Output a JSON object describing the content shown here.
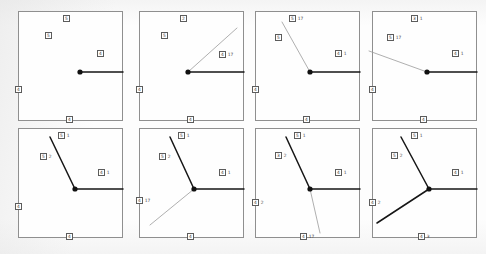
{
  "figure": {
    "type": "multi-panel-line-diagram",
    "panel_count": 8,
    "rows": 2,
    "cols": 4,
    "background_color": "#fdfdfd",
    "panel_border_color": "#8f8f8f",
    "hub_color": "#111111",
    "solid_line_color": "#161616",
    "faint_line_color": "#9a9a9a"
  },
  "panels": [
    {
      "id": "panel-1",
      "name": "panel-1",
      "hub": {
        "x": 61,
        "y": 60
      },
      "edges": [
        {
          "name": "edge-right",
          "style": "solid",
          "x2": 104,
          "y2": 60
        }
      ],
      "labels": [
        {
          "name": "label-top",
          "box": "5",
          "val": "",
          "x": 44,
          "y": 3
        },
        {
          "name": "label-inner",
          "box": "5",
          "val": "",
          "x": 26,
          "y": 20
        },
        {
          "name": "label-right",
          "box": "4",
          "val": "",
          "x": 78,
          "y": 38
        },
        {
          "name": "label-left",
          "box": "4",
          "val": "",
          "x": -4,
          "y": 74
        },
        {
          "name": "label-bottom",
          "box": "4",
          "val": "",
          "x": 47,
          "y": 104
        }
      ]
    },
    {
      "id": "panel-2",
      "name": "panel-2",
      "hub": {
        "x": 48,
        "y": 60
      },
      "edges": [
        {
          "name": "edge-right",
          "style": "solid",
          "x2": 104,
          "y2": 60
        },
        {
          "name": "edge-up-right",
          "style": "faint",
          "x2": 97,
          "y2": 16
        }
      ],
      "labels": [
        {
          "name": "label-top",
          "box": "2",
          "val": "",
          "x": 40,
          "y": 3
        },
        {
          "name": "label-inner",
          "box": "5",
          "val": "",
          "x": 21,
          "y": 20
        },
        {
          "name": "label-right",
          "box": "4",
          "val": "17",
          "x": 79,
          "y": 39
        },
        {
          "name": "label-left",
          "box": "4",
          "val": "",
          "x": -4,
          "y": 74
        },
        {
          "name": "label-bottom",
          "box": "4",
          "val": "",
          "x": 47,
          "y": 104
        }
      ]
    },
    {
      "id": "panel-3",
      "name": "panel-3",
      "hub": {
        "x": 54,
        "y": 60
      },
      "edges": [
        {
          "name": "edge-right",
          "style": "solid",
          "x2": 104,
          "y2": 60
        },
        {
          "name": "edge-up-left",
          "style": "faint",
          "x2": 26,
          "y2": 10
        }
      ],
      "labels": [
        {
          "name": "label-top",
          "box": "5",
          "val": "17",
          "x": 33,
          "y": 3
        },
        {
          "name": "label-inner",
          "box": "5",
          "val": "",
          "x": 19,
          "y": 22
        },
        {
          "name": "label-right",
          "box": "4",
          "val": "1",
          "x": 79,
          "y": 38
        },
        {
          "name": "label-left",
          "box": "4",
          "val": "",
          "x": -4,
          "y": 74
        },
        {
          "name": "label-bottom",
          "box": "4",
          "val": "",
          "x": 47,
          "y": 104
        }
      ]
    },
    {
      "id": "panel-4",
      "name": "panel-4",
      "hub": {
        "x": 54,
        "y": 60
      },
      "edges": [
        {
          "name": "edge-right",
          "style": "solid",
          "x2": 104,
          "y2": 60
        },
        {
          "name": "edge-up-left",
          "style": "faint",
          "x2": -4,
          "y2": 39
        }
      ],
      "labels": [
        {
          "name": "label-top",
          "box": "3",
          "val": "1",
          "x": 38,
          "y": 3
        },
        {
          "name": "label-inner",
          "box": "5",
          "val": "17",
          "x": 14,
          "y": 22
        },
        {
          "name": "label-right",
          "box": "4",
          "val": "1",
          "x": 79,
          "y": 38
        },
        {
          "name": "label-left",
          "box": "4",
          "val": "",
          "x": -4,
          "y": 74
        },
        {
          "name": "label-bottom",
          "box": "4",
          "val": "",
          "x": 47,
          "y": 104
        }
      ]
    },
    {
      "id": "panel-5",
      "name": "panel-5",
      "hub": {
        "x": 56,
        "y": 60
      },
      "edges": [
        {
          "name": "edge-right",
          "style": "solid",
          "x2": 104,
          "y2": 60
        },
        {
          "name": "edge-up-left",
          "style": "solid",
          "x2": 31,
          "y2": 8
        }
      ],
      "labels": [
        {
          "name": "label-top",
          "box": "5",
          "val": "1",
          "x": 39,
          "y": 3
        },
        {
          "name": "label-inner",
          "box": "5",
          "val": "2",
          "x": 21,
          "y": 24
        },
        {
          "name": "label-right",
          "box": "4",
          "val": "1",
          "x": 79,
          "y": 40
        },
        {
          "name": "label-left",
          "box": "4",
          "val": "",
          "x": -4,
          "y": 74
        },
        {
          "name": "label-bottom",
          "box": "4",
          "val": "",
          "x": 47,
          "y": 104
        }
      ]
    },
    {
      "id": "panel-6",
      "name": "panel-6",
      "hub": {
        "x": 54,
        "y": 60
      },
      "edges": [
        {
          "name": "edge-right",
          "style": "solid",
          "x2": 104,
          "y2": 60
        },
        {
          "name": "edge-up-left",
          "style": "solid",
          "x2": 30,
          "y2": 8
        },
        {
          "name": "edge-down-left",
          "style": "faint",
          "x2": 10,
          "y2": 96
        }
      ],
      "labels": [
        {
          "name": "label-top",
          "box": "5",
          "val": "1",
          "x": 38,
          "y": 3
        },
        {
          "name": "label-inner",
          "box": "5",
          "val": "2",
          "x": 19,
          "y": 24
        },
        {
          "name": "label-right",
          "box": "4",
          "val": "1",
          "x": 79,
          "y": 40
        },
        {
          "name": "label-left",
          "box": "4",
          "val": "17",
          "x": -4,
          "y": 68
        },
        {
          "name": "label-bottom",
          "box": "4",
          "val": "",
          "x": 47,
          "y": 104
        }
      ]
    },
    {
      "id": "panel-7",
      "name": "panel-7",
      "hub": {
        "x": 54,
        "y": 60
      },
      "edges": [
        {
          "name": "edge-right",
          "style": "solid",
          "x2": 104,
          "y2": 60
        },
        {
          "name": "edge-up-left",
          "style": "solid",
          "x2": 30,
          "y2": 8
        },
        {
          "name": "edge-down-right",
          "style": "faint",
          "x2": 64,
          "y2": 104
        }
      ],
      "labels": [
        {
          "name": "label-top",
          "box": "5",
          "val": "1",
          "x": 38,
          "y": 3
        },
        {
          "name": "label-inner",
          "box": "3",
          "val": "2",
          "x": 19,
          "y": 23
        },
        {
          "name": "label-right",
          "box": "4",
          "val": "1",
          "x": 79,
          "y": 40
        },
        {
          "name": "label-left",
          "box": "4",
          "val": "2",
          "x": -4,
          "y": 70
        },
        {
          "name": "label-bottom",
          "box": "4",
          "val": "17",
          "x": 44,
          "y": 104
        }
      ]
    },
    {
      "id": "panel-8",
      "name": "panel-8",
      "hub": {
        "x": 56,
        "y": 60
      },
      "edges": [
        {
          "name": "edge-right",
          "style": "solid",
          "x2": 104,
          "y2": 60
        },
        {
          "name": "edge-up-left",
          "style": "solid",
          "x2": 28,
          "y2": 8
        },
        {
          "name": "edge-down-left",
          "style": "solid",
          "x2": 4,
          "y2": 94
        }
      ],
      "labels": [
        {
          "name": "label-top",
          "box": "5",
          "val": "1",
          "x": 38,
          "y": 3
        },
        {
          "name": "label-inner",
          "box": "5",
          "val": "2",
          "x": 18,
          "y": 23
        },
        {
          "name": "label-right",
          "box": "4",
          "val": "1",
          "x": 79,
          "y": 40
        },
        {
          "name": "label-left",
          "box": "4",
          "val": "2",
          "x": -4,
          "y": 70
        },
        {
          "name": "label-bottom",
          "box": "4",
          "val": "3",
          "x": 45,
          "y": 104
        }
      ]
    }
  ]
}
